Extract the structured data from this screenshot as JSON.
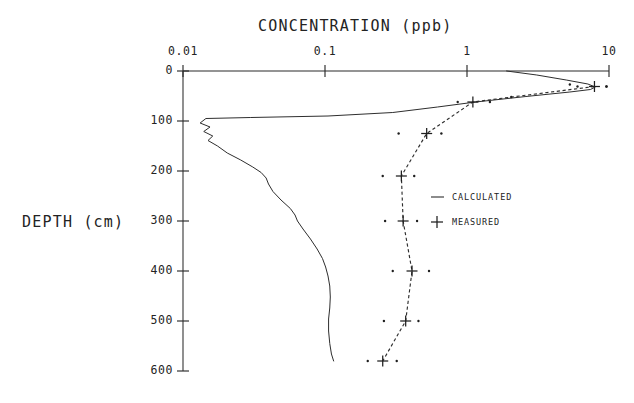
{
  "chart_data": {
    "type": "line",
    "title": "CONCENTRATION (ppb)",
    "xlabel": "CONCENTRATION (ppb)",
    "ylabel": "DEPTH (cm)",
    "xscale": "log",
    "xlim": [
      0.01,
      10
    ],
    "ylim": [
      0,
      600
    ],
    "y_inverted": true,
    "grid": false,
    "xticks": [
      0.01,
      0.1,
      1,
      10
    ],
    "xtick_labels": [
      "0.01",
      "0.1",
      "1",
      "10"
    ],
    "yticks": [
      0,
      100,
      200,
      300,
      400,
      500,
      600
    ],
    "ytick_labels": [
      "0",
      "100",
      "200",
      "300",
      "400",
      "500",
      "600"
    ],
    "legend_position": "center-right",
    "series": [
      {
        "name": "CALCULATED",
        "style": "solid-line",
        "marker": "none",
        "comment": "closed loop profile: right limb rises from surface to ~8 ppb peak at 30 cm, returns leftward to ~0.013 ppb near 95 cm, then left limb descends to 580 cm",
        "points": [
          {
            "conc": 1.9,
            "depth": 0
          },
          {
            "conc": 3.1,
            "depth": 8
          },
          {
            "conc": 5.0,
            "depth": 18
          },
          {
            "conc": 7.1,
            "depth": 26
          },
          {
            "conc": 8.0,
            "depth": 32
          },
          {
            "conc": 7.4,
            "depth": 37
          },
          {
            "conc": 5.3,
            "depth": 42
          },
          {
            "conc": 2.6,
            "depth": 51
          },
          {
            "conc": 1.15,
            "depth": 62
          },
          {
            "conc": 0.62,
            "depth": 72
          },
          {
            "conc": 0.3,
            "depth": 83
          },
          {
            "conc": 0.105,
            "depth": 90
          },
          {
            "conc": 0.03,
            "depth": 93
          },
          {
            "conc": 0.0145,
            "depth": 95
          },
          {
            "conc": 0.0132,
            "depth": 104
          },
          {
            "conc": 0.0155,
            "depth": 112
          },
          {
            "conc": 0.014,
            "depth": 121
          },
          {
            "conc": 0.0162,
            "depth": 130
          },
          {
            "conc": 0.015,
            "depth": 139
          },
          {
            "conc": 0.0175,
            "depth": 150
          },
          {
            "conc": 0.0205,
            "depth": 164
          },
          {
            "conc": 0.0255,
            "depth": 178
          },
          {
            "conc": 0.031,
            "depth": 192
          },
          {
            "conc": 0.0355,
            "depth": 203
          },
          {
            "conc": 0.0385,
            "depth": 214
          },
          {
            "conc": 0.04,
            "depth": 226
          },
          {
            "conc": 0.043,
            "depth": 241
          },
          {
            "conc": 0.049,
            "depth": 258
          },
          {
            "conc": 0.057,
            "depth": 275
          },
          {
            "conc": 0.0615,
            "depth": 288
          },
          {
            "conc": 0.064,
            "depth": 300
          },
          {
            "conc": 0.07,
            "depth": 316
          },
          {
            "conc": 0.079,
            "depth": 336
          },
          {
            "conc": 0.088,
            "depth": 356
          },
          {
            "conc": 0.096,
            "depth": 375
          },
          {
            "conc": 0.101,
            "depth": 392
          },
          {
            "conc": 0.105,
            "depth": 410
          },
          {
            "conc": 0.108,
            "depth": 430
          },
          {
            "conc": 0.109,
            "depth": 452
          },
          {
            "conc": 0.108,
            "depth": 474
          },
          {
            "conc": 0.106,
            "depth": 496
          },
          {
            "conc": 0.106,
            "depth": 520
          },
          {
            "conc": 0.108,
            "depth": 545
          },
          {
            "conc": 0.111,
            "depth": 566
          },
          {
            "conc": 0.115,
            "depth": 580
          }
        ]
      },
      {
        "name": "MEASURED",
        "style": "dashed-line-with-plus-markers",
        "marker": "plus",
        "comment": "measured samples with flanking uncertainty dots; dashed line connects the plus markers",
        "points": [
          {
            "conc": 7.9,
            "depth": 31,
            "err_low": 6.0,
            "err_high": 9.6
          },
          {
            "conc": 1.1,
            "depth": 62,
            "err_low": 0.86,
            "err_high": 1.45
          },
          {
            "conc": 0.52,
            "depth": 125,
            "err_low": 0.33,
            "err_high": 0.66
          },
          {
            "conc": 0.345,
            "depth": 210,
            "err_low": 0.255,
            "err_high": 0.425
          },
          {
            "conc": 0.355,
            "depth": 300,
            "err_low": 0.265,
            "err_high": 0.445
          },
          {
            "conc": 0.41,
            "depth": 400,
            "err_low": 0.3,
            "err_high": 0.54
          },
          {
            "conc": 0.37,
            "depth": 500,
            "err_low": 0.26,
            "err_high": 0.455
          },
          {
            "conc": 0.255,
            "depth": 580,
            "err_low": 0.2,
            "err_high": 0.32
          }
        ]
      }
    ],
    "extra_uncertainty_dots": [
      {
        "conc": 5.3,
        "depth": 27
      },
      {
        "conc": 9.6,
        "depth": 31
      },
      {
        "conc": 2.05,
        "depth": 52
      }
    ],
    "legend": [
      {
        "label": "CALCULATED",
        "symbol": "solid-line"
      },
      {
        "label": "MEASURED",
        "symbol": "plus"
      }
    ]
  },
  "colors": {
    "ink": "#2b2b2b",
    "background": "#ffffff"
  }
}
